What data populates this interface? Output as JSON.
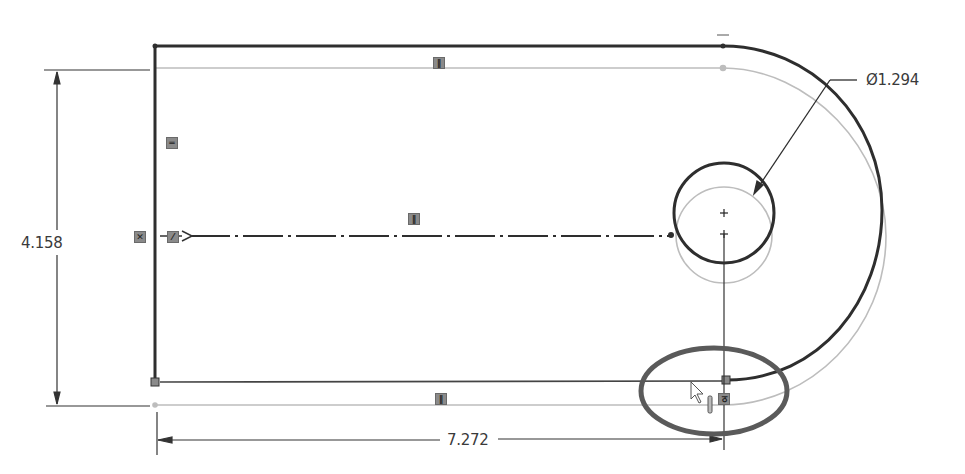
{
  "app": {
    "context": "CAD sketch editor (2D sketch, dragging sketch profile)"
  },
  "dimensions": {
    "vertical_height": "4.158",
    "horizontal_length": "7.272",
    "hole_diameter": "Ø1.294"
  },
  "relations": {
    "top_line": "horizontal",
    "left_line": "vertical",
    "bottom_line": "horizontal",
    "centerline": "horizontal",
    "left_endpoint_1": "coincident",
    "left_endpoint_2": "collinear",
    "tangent_point": "tangent"
  },
  "colors": {
    "profile": "#2e2e2e",
    "ghost_profile": "#b8b8b8",
    "dimension": "#3a3a3a",
    "highlight_ellipse": "#5a5a5a",
    "badge": "#8a8a8a"
  },
  "relation_glyphs": {
    "horizontal": "‖",
    "vertical": "═",
    "coincident": "✕",
    "collinear": "⁄",
    "tangent": "ठ"
  },
  "cursor": {
    "type": "arrow-pointer",
    "x": 692,
    "y": 382
  }
}
